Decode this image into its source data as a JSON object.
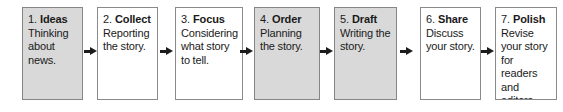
{
  "diagram": {
    "type": "linear-process-flow",
    "title": "",
    "orientation": "horizontal",
    "step_count": 7,
    "arrow_count": 6,
    "colors": {
      "box_fill_highlight": "#d9d9d9",
      "box_fill_plain": "#ffffff",
      "box_border": "#8a8a8a",
      "text": "#1a1a1a",
      "arrow": "#1c1c1c",
      "canvas": "#ffffff"
    },
    "steps": [
      {
        "number": "1.",
        "word": "Ideas",
        "description": "Thinking about news.",
        "highlighted": true,
        "left": 22,
        "width": 61
      },
      {
        "number": "2.",
        "word": "Collect",
        "description": "Reporting the story.",
        "highlighted": false,
        "left": 97,
        "width": 61
      },
      {
        "number": "3.",
        "word": "Focus",
        "description": "Considering what story to tell.",
        "highlighted": false,
        "left": 175,
        "width": 68
      },
      {
        "number": "4.",
        "word": "Order",
        "description": "Planning the story.",
        "highlighted": true,
        "left": 254,
        "width": 66
      },
      {
        "number": "5.",
        "word": "Draft",
        "description": "Writing the story.",
        "highlighted": true,
        "left": 334,
        "width": 63
      },
      {
        "number": "6.",
        "word": "Share",
        "description": "Discuss your story.",
        "highlighted": false,
        "left": 420,
        "width": 61
      },
      {
        "number": "7.",
        "word": "Polish",
        "description": "Revise your story for readers and editors.",
        "highlighted": false,
        "left": 495,
        "width": 62
      }
    ],
    "arrows": [
      {
        "name": "arrow-1-to-2",
        "left": 84
      },
      {
        "name": "arrow-2-to-3",
        "left": 160
      },
      {
        "name": "arrow-3-to-4",
        "left": 240
      },
      {
        "name": "arrow-4-to-5",
        "left": 320
      },
      {
        "name": "arrow-5-to-6",
        "left": 400
      },
      {
        "name": "arrow-6-to-7",
        "left": 481
      }
    ]
  }
}
